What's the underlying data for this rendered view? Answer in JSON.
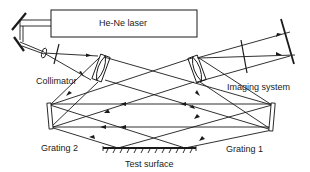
{
  "diagram": {
    "type": "optical-setup",
    "components": {
      "laser": "He-Ne laser",
      "collimator": "Collimator",
      "imaging_system": "Imaging system",
      "grating_1": "Grating 1",
      "grating_2": "Grating 2",
      "test_surface": "Test surface"
    },
    "colors": {
      "line": "#1a1a1a",
      "background": "#ffffff"
    }
  }
}
